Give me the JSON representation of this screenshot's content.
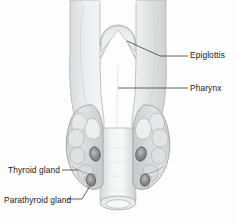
{
  "figure": {
    "style": "grayscale scanned medical line drawing",
    "background_color": "#fdfdfd",
    "ink_color": "#1b1b1b",
    "tissue_fill": "#eceded",
    "tissue_shadow": "#d6d7d8",
    "outline_color": "#9a9b9c",
    "gland_dark": "#78797a"
  },
  "labels": [
    {
      "id": "epiglottis",
      "text": "Epiglottis",
      "side": "right",
      "leader": "angled then horizontal",
      "points_to": "dome-shaped epiglottis above the thyroid cartilage notch"
    },
    {
      "id": "pharynx",
      "text": "Pharynx",
      "side": "right",
      "leader": "horizontal",
      "points_to": "central body of the laryngeal / pharyngeal wall"
    },
    {
      "id": "thyroid_gland",
      "text": "Thyroid gland",
      "side": "left",
      "leader": "horizontal",
      "points_to": "left lobe of the lobulated thyroid gland"
    },
    {
      "id": "parathyroid_gland",
      "text": "Parathyroid gland",
      "side": "left",
      "leader": "angled upward to the right",
      "points_to": "small dark oval embedded in the lower thyroid lobe"
    }
  ],
  "structures": [
    {
      "name": "epiglottis",
      "description": "rounded dome arc nested in the superior thyroid notch"
    },
    {
      "name": "thyroid-cartilage",
      "description": "large shield-shaped cartilage with a deep V-shaped superior notch"
    },
    {
      "name": "pharynx",
      "description": "pale central column continuous with the laryngeal body"
    },
    {
      "name": "thyroid-gland-left-lobe",
      "description": "lumpy lobulated mass on the viewer's left of the trachea"
    },
    {
      "name": "thyroid-gland-right-lobe",
      "description": "lumpy lobulated mass on the viewer's right of the trachea"
    },
    {
      "name": "parathyroid-glands",
      "count": 4,
      "description": "small dark ovals, two on each thyroid lobe"
    },
    {
      "name": "trachea",
      "description": "tapering tube below the larynx ending in an elliptical open lumen"
    }
  ]
}
